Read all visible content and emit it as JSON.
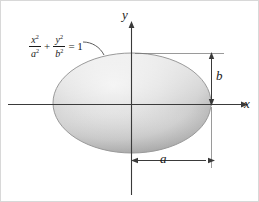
{
  "figure": {
    "type": "ellipse-diagram",
    "background_color": "#ffffff",
    "line_color": "#1a1a1a",
    "ellipse_fill_light": "#e6e6e6",
    "ellipse_fill_dark": "#a9a9a9",
    "axes": {
      "x_label": "x",
      "y_label": "y"
    },
    "equation": {
      "numerator_1": "x",
      "numerator_1_exp": "2",
      "denominator_1": "a",
      "denominator_1_exp": "2",
      "operator": "+",
      "numerator_2": "y",
      "numerator_2_exp": "2",
      "denominator_2": "b",
      "denominator_2_exp": "2",
      "equals": "= 1"
    },
    "dimensions": {
      "semi_major_label": "a",
      "semi_minor_label": "b"
    }
  },
  "chart_data": {
    "type": "scatter",
    "title": "",
    "xlabel": "x",
    "ylabel": "y",
    "annotations": [
      "x²/a² + y²/b² = 1",
      "a",
      "b"
    ],
    "shape": "ellipse",
    "center": [
      0,
      0
    ],
    "semi_major_axis_a": 1.0,
    "semi_minor_axis_b": 0.6,
    "grid": false,
    "legend": "none"
  }
}
